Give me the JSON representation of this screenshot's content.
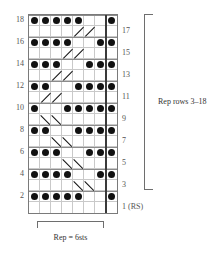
{
  "chart_data": {
    "type": "table",
    "columns": 8,
    "rows": 18,
    "cell_px": 11,
    "symbols": {
      "dot": "purl / knit-dot symbol",
      "diagonal": "cable cross line"
    },
    "row_numbers_left": [
      18,
      16,
      14,
      12,
      10,
      8,
      6,
      4,
      2
    ],
    "row_numbers_right": [
      "17",
      "15",
      "13",
      "11",
      "9",
      "7",
      "5",
      "3",
      "1 (RS)"
    ],
    "repeat_column_marker": 7,
    "dot_rows": [
      {
        "row": 18,
        "cols": [
          1,
          2,
          3,
          4,
          5,
          8
        ]
      },
      {
        "row": 16,
        "cols": [
          1,
          2,
          3,
          4,
          7,
          8
        ]
      },
      {
        "row": 14,
        "cols": [
          1,
          2,
          3,
          6,
          7,
          8
        ]
      },
      {
        "row": 12,
        "cols": [
          1,
          2,
          5,
          6,
          7,
          8
        ]
      },
      {
        "row": 10,
        "cols": [
          1,
          4,
          5,
          6,
          7,
          8
        ]
      },
      {
        "row": 8,
        "cols": [
          1,
          2,
          5,
          6,
          7,
          8
        ]
      },
      {
        "row": 6,
        "cols": [
          1,
          2,
          3,
          6,
          7,
          8
        ]
      },
      {
        "row": 4,
        "cols": [
          1,
          2,
          3,
          4,
          7,
          8
        ]
      },
      {
        "row": 2,
        "cols": [
          1,
          2,
          3,
          4,
          5,
          8
        ]
      }
    ],
    "diagonals": [
      {
        "row": 17,
        "col": 5,
        "dir": "up-right"
      },
      {
        "row": 17,
        "col": 6,
        "dir": "up-right"
      },
      {
        "row": 15,
        "col": 4,
        "dir": "up-right"
      },
      {
        "row": 15,
        "col": 5,
        "dir": "up-right"
      },
      {
        "row": 13,
        "col": 3,
        "dir": "up-right"
      },
      {
        "row": 13,
        "col": 4,
        "dir": "up-right"
      },
      {
        "row": 11,
        "col": 2,
        "dir": "up-right"
      },
      {
        "row": 11,
        "col": 3,
        "dir": "up-right"
      },
      {
        "row": 9,
        "col": 2,
        "dir": "down-right"
      },
      {
        "row": 9,
        "col": 3,
        "dir": "down-right"
      },
      {
        "row": 7,
        "col": 3,
        "dir": "down-right"
      },
      {
        "row": 7,
        "col": 4,
        "dir": "down-right"
      },
      {
        "row": 5,
        "col": 4,
        "dir": "down-right"
      },
      {
        "row": 5,
        "col": 5,
        "dir": "down-right"
      },
      {
        "row": 3,
        "col": 5,
        "dir": "down-right"
      },
      {
        "row": 3,
        "col": 6,
        "dir": "down-right"
      }
    ],
    "annotations": {
      "rep_rows": "Rep rows 3–18",
      "rep_sts": "Rep = 6sts"
    }
  },
  "labels": {
    "rep_rows": "Rep rows 3–18",
    "rep_sts": "Rep = 6sts"
  }
}
